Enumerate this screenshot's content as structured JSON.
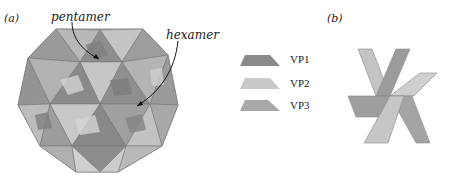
{
  "figure": {
    "panel_a": {
      "label": "(a)",
      "annotations": [
        {
          "id": "pentamer",
          "text": "pentamer"
        },
        {
          "id": "hexamer",
          "text": "hexamer"
        }
      ]
    },
    "panel_b": {
      "label": "(b)"
    },
    "legend": [
      {
        "id": "vp1",
        "label": "VP1",
        "color": "#8a8a8a"
      },
      {
        "id": "vp2",
        "label": "VP2",
        "color": "#c9c9c9"
      },
      {
        "id": "vp3",
        "label": "VP3",
        "color": "#a8a8a8"
      }
    ],
    "colors": {
      "vp1": "#8a8a8a",
      "vp2": "#c9c9c9",
      "vp3": "#a8a8a8",
      "edge": "#6e6e6e",
      "arrow": "#111111"
    }
  }
}
